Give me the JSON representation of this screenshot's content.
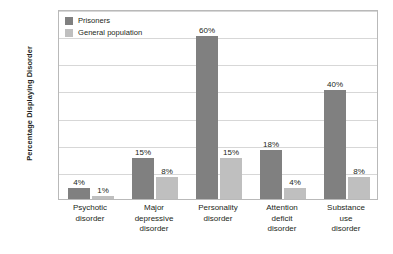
{
  "chart_data": {
    "type": "bar",
    "title": "",
    "xlabel": "",
    "ylabel": "Percentage Displaying Disorder",
    "ylim": [
      0,
      70
    ],
    "grid": true,
    "gridline_values": [
      0,
      10,
      20,
      30,
      40,
      50,
      60,
      70
    ],
    "legend_position": "top-left",
    "axis_tick_labels": [],
    "categories": [
      "Psychotic disorder",
      "Major depressive disorder",
      "Personality disorder",
      "Attention deficit disorder",
      "Substance use disorder"
    ],
    "category_lines": [
      [
        "Psychotic",
        "disorder"
      ],
      [
        "Major",
        "depressive",
        "disorder"
      ],
      [
        "Personality",
        "disorder"
      ],
      [
        "Attention",
        "deficit",
        "disorder"
      ],
      [
        "Substance",
        "use",
        "disorder"
      ]
    ],
    "series": [
      {
        "name": "Prisoners",
        "color": "#808080",
        "values": [
          4,
          15,
          60,
          18,
          40
        ],
        "labels": [
          "4%",
          "15%",
          "60%",
          "18%",
          "40%"
        ]
      },
      {
        "name": "General population",
        "color": "#bfbfbf",
        "values": [
          1,
          8,
          15,
          4,
          8
        ],
        "labels": [
          "1%",
          "8%",
          "15%",
          "4%",
          "8%"
        ]
      }
    ]
  },
  "legend": {
    "items": [
      {
        "label": "Prisoners",
        "color": "#808080"
      },
      {
        "label": "General population",
        "color": "#bfbfbf"
      }
    ]
  },
  "axis": {
    "y_title": "Percentage Displaying Disorder"
  },
  "colors": {
    "background": "#ffffff",
    "frame": "#b9b9b9",
    "gridline": "#d7d7d7",
    "text": "#231f20",
    "series_prisoners": "#808080",
    "series_general": "#bfbfbf"
  }
}
